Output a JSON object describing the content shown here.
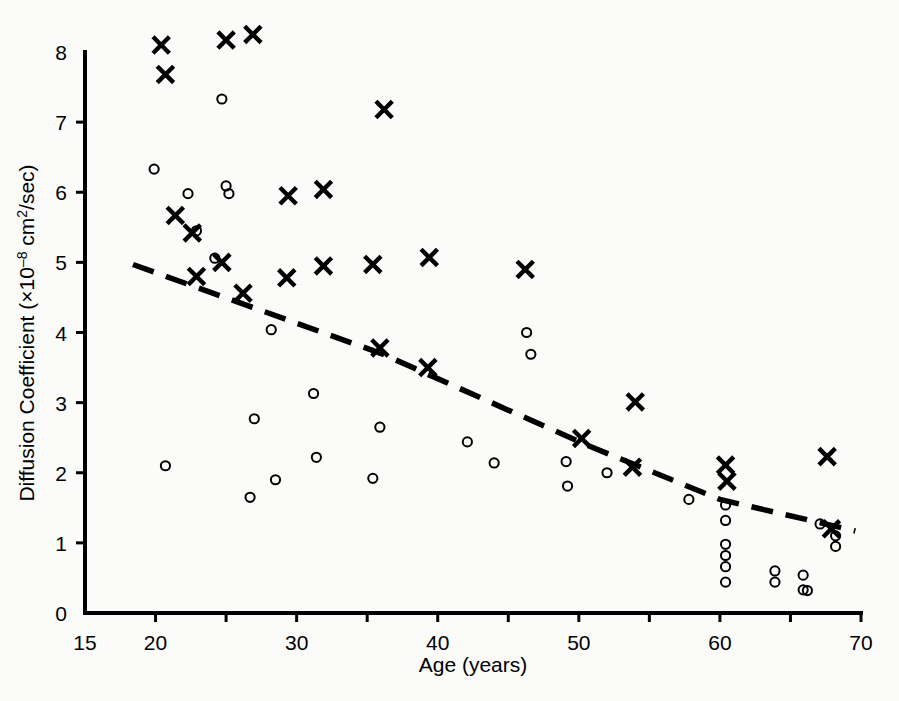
{
  "chart_data": {
    "type": "scatter",
    "title": "",
    "xlabel": "Age (years)",
    "ylabel": "Diffusion Coefficient (×10–8 cm2/sec)",
    "ylabel_parts": {
      "prefix": "Diffusion Coefficient (×10",
      "exponent": "–8",
      "suffix_a": " cm",
      "suffix_exp": "2",
      "suffix_b": "/sec)"
    },
    "xlim": [
      15,
      70
    ],
    "ylim": [
      0,
      8
    ],
    "xticks": [
      15,
      20,
      25,
      30,
      35,
      40,
      45,
      50,
      55,
      60,
      65,
      70
    ],
    "xtick_labels": [
      {
        "value": 15,
        "label": "15"
      },
      {
        "value": 20,
        "label": "20"
      },
      {
        "value": 30,
        "label": "30"
      },
      {
        "value": 40,
        "label": "40"
      },
      {
        "value": 50,
        "label": "50"
      },
      {
        "value": 60,
        "label": "60"
      },
      {
        "value": 70,
        "label": "70"
      }
    ],
    "yticks": [
      0,
      1,
      2,
      3,
      4,
      5,
      6,
      7,
      8
    ],
    "ytick_labels": [
      "0",
      "1",
      "2",
      "3",
      "4",
      "5",
      "6",
      "7",
      "8"
    ],
    "grid": false,
    "legend": "none",
    "marker_colors": {
      "cross": "#000000",
      "circle": "#000000"
    },
    "series": [
      {
        "name": "cross",
        "marker": "x",
        "points": [
          [
            20.4,
            8.1
          ],
          [
            20.7,
            7.68
          ],
          [
            25.0,
            8.17
          ],
          [
            26.9,
            8.25
          ],
          [
            36.2,
            7.18
          ],
          [
            21.4,
            5.67
          ],
          [
            29.4,
            5.95
          ],
          [
            31.9,
            6.04
          ],
          [
            22.6,
            5.42
          ],
          [
            24.7,
            5.0
          ],
          [
            22.9,
            4.8
          ],
          [
            26.2,
            4.56
          ],
          [
            29.3,
            4.78
          ],
          [
            31.9,
            4.95
          ],
          [
            35.4,
            4.97
          ],
          [
            39.4,
            5.07
          ],
          [
            46.2,
            4.9
          ],
          [
            35.9,
            3.78
          ],
          [
            39.3,
            3.5
          ],
          [
            54.0,
            3.01
          ],
          [
            50.2,
            2.49
          ],
          [
            53.8,
            2.08
          ],
          [
            60.4,
            2.11
          ],
          [
            60.5,
            1.88
          ],
          [
            67.6,
            2.23
          ],
          [
            67.9,
            1.2
          ]
        ]
      },
      {
        "name": "circle",
        "marker": "o",
        "points": [
          [
            24.7,
            7.33
          ],
          [
            19.9,
            6.33
          ],
          [
            22.3,
            5.98
          ],
          [
            25.0,
            6.09
          ],
          [
            25.2,
            5.98
          ],
          [
            22.9,
            5.45
          ],
          [
            24.2,
            5.06
          ],
          [
            26.7,
            1.65
          ],
          [
            28.2,
            4.04
          ],
          [
            27.0,
            2.77
          ],
          [
            28.5,
            1.9
          ],
          [
            31.2,
            3.13
          ],
          [
            31.4,
            2.22
          ],
          [
            20.7,
            2.1
          ],
          [
            35.9,
            2.65
          ],
          [
            35.4,
            1.92
          ],
          [
            42.1,
            2.44
          ],
          [
            44.0,
            2.14
          ],
          [
            46.3,
            4.0
          ],
          [
            46.6,
            3.69
          ],
          [
            49.1,
            2.16
          ],
          [
            49.2,
            1.81
          ],
          [
            52.0,
            2.0
          ],
          [
            57.8,
            1.62
          ],
          [
            60.4,
            1.54
          ],
          [
            60.4,
            1.32
          ],
          [
            60.4,
            0.98
          ],
          [
            60.4,
            0.82
          ],
          [
            60.4,
            0.66
          ],
          [
            60.4,
            0.44
          ],
          [
            63.9,
            0.6
          ],
          [
            63.9,
            0.44
          ],
          [
            66.2,
            0.32
          ],
          [
            67.1,
            1.27
          ],
          [
            68.2,
            1.1
          ],
          [
            68.2,
            0.95
          ],
          [
            65.9,
            0.54
          ],
          [
            65.9,
            0.33
          ]
        ]
      }
    ],
    "trend_line": {
      "style": "dashed",
      "points": [
        [
          18.4,
          4.97
        ],
        [
          36.0,
          3.7
        ],
        [
          50.5,
          2.4
        ],
        [
          60.0,
          1.62
        ],
        [
          69.6,
          1.17
        ]
      ]
    }
  }
}
